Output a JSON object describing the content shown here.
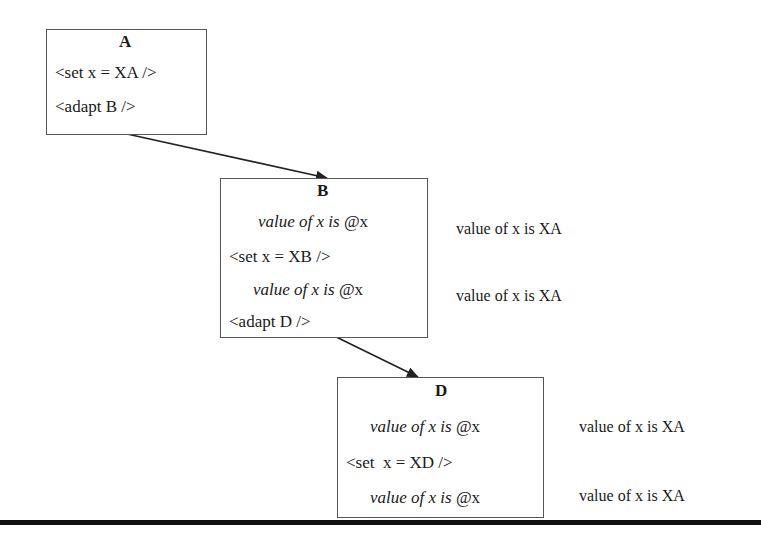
{
  "diagram": {
    "nodes": [
      {
        "id": "A",
        "title": "A",
        "lines": [
          {
            "text": "<set x = XA />",
            "style": "normal"
          },
          {
            "text": "<adapt B />",
            "style": "normal"
          }
        ]
      },
      {
        "id": "B",
        "title": "B",
        "lines": [
          {
            "text_italic": "value of x is ",
            "text_normal": "@x",
            "style": "italic",
            "annotation": "value of x is XA"
          },
          {
            "text": "<set x = XB />",
            "style": "normal"
          },
          {
            "text_italic": "value of x is ",
            "text_normal": "@x",
            "style": "italic",
            "annotation": "value of x is XA"
          },
          {
            "text": "<adapt D />",
            "style": "normal"
          }
        ]
      },
      {
        "id": "D",
        "title": "D",
        "lines": [
          {
            "text_italic": "value of x is ",
            "text_normal": "@x",
            "style": "italic",
            "annotation": "value of x is XA"
          },
          {
            "text": "<set  x = XD />",
            "style": "normal"
          },
          {
            "text_italic": "value of x is ",
            "text_normal": "@x",
            "style": "italic",
            "annotation": "value of x is XA"
          }
        ]
      }
    ],
    "edges": [
      {
        "from": "A",
        "to": "B"
      },
      {
        "from": "B",
        "to": "D"
      }
    ],
    "colors": {
      "box_border": "#555555",
      "arrow": "#222222",
      "rule": "#111111"
    }
  }
}
